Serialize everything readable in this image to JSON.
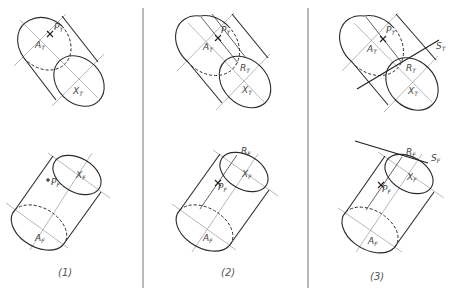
{
  "figure": {
    "panels": [
      {
        "caption": "(1)",
        "top_view": {
          "labels": {
            "P": "P",
            "P_sub": "T",
            "A": "A",
            "A_sub": "T",
            "X": "X",
            "X_sub": "T"
          }
        },
        "front_view": {
          "labels": {
            "P": "P",
            "P_sub": "F",
            "A": "A",
            "A_sub": "F",
            "X": "X",
            "X_sub": "F"
          }
        }
      },
      {
        "caption": "(2)",
        "top_view": {
          "labels": {
            "P": "P",
            "P_sub": "T",
            "A": "A",
            "A_sub": "T",
            "X": "X",
            "X_sub": "T",
            "R": "R",
            "R_sub": "T"
          }
        },
        "front_view": {
          "labels": {
            "P": "P",
            "P_sub": "F",
            "A": "A",
            "A_sub": "F",
            "X": "X",
            "X_sub": "F",
            "R": "R",
            "R_sub": "F"
          }
        }
      },
      {
        "caption": "(3)",
        "top_view": {
          "labels": {
            "P": "P",
            "P_sub": "T",
            "A": "A",
            "A_sub": "T",
            "X": "X",
            "X_sub": "T",
            "R": "R",
            "R_sub": "T",
            "S": "S",
            "S_sub": "T"
          }
        },
        "front_view": {
          "labels": {
            "P": "P",
            "P_sub": "F",
            "A": "A",
            "A_sub": "F",
            "X": "X",
            "X_sub": "F",
            "R": "R",
            "R_sub": "F",
            "S": "S",
            "S_sub": "F"
          }
        }
      }
    ]
  }
}
